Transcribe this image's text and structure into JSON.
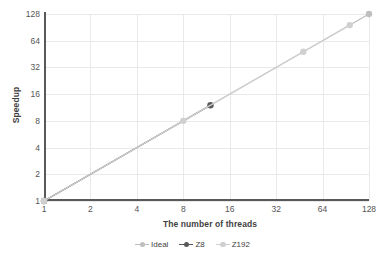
{
  "chart_data": {
    "type": "line",
    "title": "",
    "xlabel": "The number of threads",
    "ylabel": "Speedup",
    "xscale": "log2",
    "yscale": "log2",
    "xlim": [
      1,
      128
    ],
    "ylim": [
      1,
      128
    ],
    "xticks": [
      "1",
      "2",
      "4",
      "8",
      "16",
      "32",
      "64",
      "128"
    ],
    "xtick_values": [
      1,
      2,
      4,
      8,
      16,
      32,
      64,
      128
    ],
    "yticks": [
      "1",
      "2",
      "4",
      "8",
      "16",
      "32",
      "64",
      "128"
    ],
    "ytick_values": [
      1,
      2,
      4,
      8,
      16,
      32,
      64,
      128
    ],
    "grid": true,
    "legend_position": "bottom",
    "series": [
      {
        "name": "Ideal",
        "color": "#bfbfbf",
        "marker": "circle",
        "x": [
          1,
          128
        ],
        "y": [
          1,
          128
        ],
        "points": [
          {
            "x": 1,
            "y": 1
          },
          {
            "x": 128,
            "y": 128
          }
        ]
      },
      {
        "name": "Z8",
        "color": "#595959",
        "marker": "circle",
        "x": [
          1,
          12
        ],
        "y": [
          1,
          12
        ],
        "points": [
          {
            "x": 1,
            "y": 1
          },
          {
            "x": 12,
            "y": 12
          }
        ]
      },
      {
        "name": "Z192",
        "color": "#d0d0d0",
        "marker": "circle",
        "x": [
          1,
          8,
          48,
          96
        ],
        "y": [
          1,
          8,
          48,
          96
        ],
        "points": [
          {
            "x": 1,
            "y": 1
          },
          {
            "x": 8,
            "y": 8
          },
          {
            "x": 48,
            "y": 48
          },
          {
            "x": 96,
            "y": 96
          }
        ]
      }
    ],
    "colors": {
      "ideal": "#bfbfbf",
      "z8": "#595959",
      "z192": "#d0d0d0",
      "axis": "#595959",
      "grid": "#e9e9e9",
      "text": "#3f3f3f",
      "background": "#ffffff"
    }
  },
  "legend": {
    "items": [
      {
        "label": "Ideal",
        "color": "#bfbfbf"
      },
      {
        "label": "Z8",
        "color": "#595959"
      },
      {
        "label": "Z192",
        "color": "#d0d0d0"
      }
    ]
  }
}
